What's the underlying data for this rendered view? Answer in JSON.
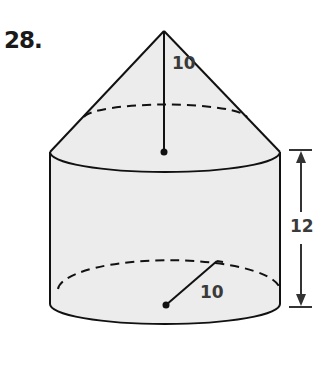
{
  "problem": {
    "number": "28."
  },
  "figure": {
    "type": "composite solid: cone on top of cylinder",
    "cone": {
      "height_label": "10"
    },
    "cylinder": {
      "height_label": "12",
      "radius_label": "10"
    },
    "colors": {
      "fill": "#ececec",
      "stroke": "#111111",
      "label": "#3a3a3a"
    }
  }
}
